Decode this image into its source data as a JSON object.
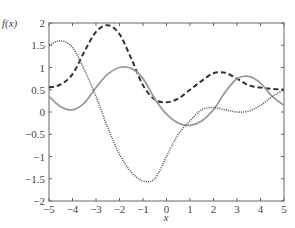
{
  "chart_data": {
    "type": "line",
    "title": "",
    "xlabel": "x",
    "ylabel": "f(x)",
    "xlim": [
      -5,
      5
    ],
    "ylim": [
      -2,
      2
    ],
    "grid": false,
    "legend": null,
    "xticks": [
      -5,
      -4,
      -3,
      -2,
      -1,
      0,
      1,
      2,
      3,
      4,
      5
    ],
    "yticks": [
      -2,
      -1.5,
      -1,
      -0.5,
      0,
      0.5,
      1,
      1.5,
      2
    ],
    "xtick_labels": [
      "−5",
      "−4",
      "−3",
      "−2",
      "−1",
      "0",
      "1",
      "2",
      "3",
      "4",
      "5"
    ],
    "ytick_labels": [
      "−2",
      "−1.5",
      "−1",
      "−0.5",
      "0",
      "0.5",
      "1",
      "1.5",
      "2"
    ],
    "x": [
      -5,
      -4.5,
      -4,
      -3.5,
      -3,
      -2.5,
      -2,
      -1.5,
      -1,
      -0.5,
      0,
      0.5,
      1,
      1.5,
      2,
      2.5,
      3,
      3.5,
      4,
      4.5,
      5
    ],
    "series": [
      {
        "name": "dashed",
        "style": "dashed",
        "color": "#333333",
        "values": [
          0.55,
          0.62,
          0.85,
          1.35,
          1.8,
          1.95,
          1.75,
          1.2,
          0.6,
          0.28,
          0.22,
          0.3,
          0.5,
          0.7,
          0.87,
          0.88,
          0.75,
          0.6,
          0.55,
          0.52,
          0.5
        ]
      },
      {
        "name": "solid",
        "style": "solid",
        "color": "#999999",
        "values": [
          0.35,
          0.12,
          0.05,
          0.2,
          0.55,
          0.85,
          1.0,
          0.98,
          0.75,
          0.3,
          -0.05,
          -0.25,
          -0.3,
          -0.2,
          0.05,
          0.45,
          0.75,
          0.8,
          0.65,
          0.35,
          0.15
        ]
      },
      {
        "name": "dotted",
        "style": "dotted",
        "color": "#555555",
        "values": [
          1.5,
          1.6,
          1.45,
          0.95,
          0.35,
          -0.35,
          -0.95,
          -1.35,
          -1.55,
          -1.5,
          -1.0,
          -0.5,
          -0.2,
          0.05,
          0.1,
          0.05,
          0.0,
          0.02,
          0.15,
          0.35,
          0.5
        ]
      }
    ]
  }
}
